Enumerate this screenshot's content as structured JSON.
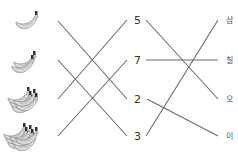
{
  "left_items": [
    {
      "label": "banana-group-1",
      "count": 2,
      "y": 20
    },
    {
      "label": "banana-group-2",
      "count": 3,
      "y": 60
    },
    {
      "label": "banana-group-3",
      "count": 5,
      "y": 99
    },
    {
      "label": "banana-group-4",
      "count": 7,
      "y": 136
    }
  ],
  "numbers": [
    {
      "text": "5",
      "y": 20
    },
    {
      "text": "7",
      "y": 60
    },
    {
      "text": "2",
      "y": 99
    },
    {
      "text": "3",
      "y": 136
    }
  ],
  "korean_words": [
    {
      "text": "삼",
      "y": 20
    },
    {
      "text": "칠",
      "y": 60
    },
    {
      "text": "오",
      "y": 99
    },
    {
      "text": "이",
      "y": 136
    }
  ],
  "left_connections": [
    {
      "from": 0,
      "to": 2
    },
    {
      "from": 1,
      "to": 3
    },
    {
      "from": 2,
      "to": 0
    },
    {
      "from": 3,
      "to": 1
    }
  ],
  "right_connections": [
    {
      "from": 0,
      "to": 2
    },
    {
      "from": 1,
      "to": 1
    },
    {
      "from": 2,
      "to": 3
    },
    {
      "from": 3,
      "to": 0
    }
  ],
  "colors": {
    "line": "#6b6b6b",
    "banana": "#bdbdbd"
  }
}
